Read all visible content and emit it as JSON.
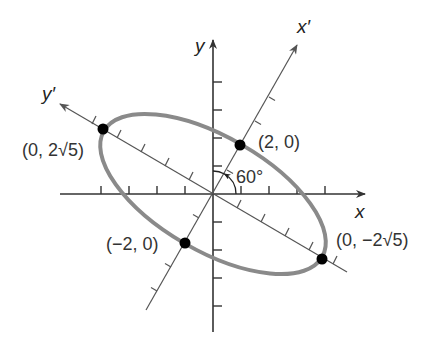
{
  "diagram": {
    "type": "rotated-ellipse",
    "axes": {
      "x_label": "x",
      "y_label": "y",
      "x_prime_label": "x′",
      "y_prime_label": "y′"
    },
    "rotation_angle_label": "60°",
    "points": [
      {
        "label": "(0, 2√5)",
        "name": "vertex-top-left"
      },
      {
        "label": "(2, 0)",
        "name": "covertex-upper"
      },
      {
        "label": "(−2, 0)",
        "name": "covertex-lower"
      },
      {
        "label": "(0, −2√5)",
        "name": "vertex-bottom-right"
      }
    ],
    "colors": {
      "ellipse": "#8a8a8a",
      "axes": "#333333",
      "rotated_axes": "#555555",
      "points": "#000000",
      "text": "#333333"
    }
  }
}
